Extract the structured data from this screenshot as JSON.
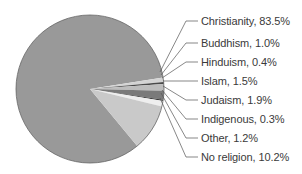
{
  "chart_data": {
    "type": "pie",
    "title": "",
    "start_angle_deg": -9,
    "direction": "clockwise",
    "slices": [
      {
        "label": "Christianity",
        "value": 83.5,
        "text": "Christianity, 83.5%",
        "color": "#999999"
      },
      {
        "label": "Buddhism",
        "value": 1.0,
        "text": "Buddhism, 1.0%",
        "color": "#d4d4d4"
      },
      {
        "label": "Hinduism",
        "value": 0.4,
        "text": "Hinduism, 0.4%",
        "color": "#4a4a4a"
      },
      {
        "label": "Islam",
        "value": 1.5,
        "text": "Islam, 1.5%",
        "color": "#bdbdbd"
      },
      {
        "label": "Judaism",
        "value": 1.9,
        "text": "Judaism, 1.9%",
        "color": "#7a7a7a"
      },
      {
        "label": "Indigenous",
        "value": 0.3,
        "text": "Indigenous, 0.3%",
        "color": "#3a3a3a"
      },
      {
        "label": "Other",
        "value": 1.2,
        "text": "Other, 1.2%",
        "color": "#eeeeee"
      },
      {
        "label": "No religion",
        "value": 10.2,
        "text": "No religion, 10.2%",
        "color": "#c9c9c9"
      }
    ],
    "legend_position": "right",
    "label_style": "leader-lines"
  }
}
